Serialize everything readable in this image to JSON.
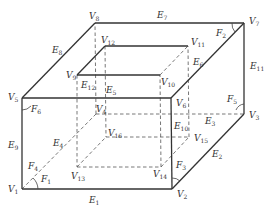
{
  "diagram": {
    "colors": {
      "line": "#333333",
      "dashed": "#555555",
      "background": "#ffffff"
    },
    "vertices": [
      {
        "id": "V1",
        "base": "V",
        "sub": "1",
        "x": 22,
        "y": 189
      },
      {
        "id": "V2",
        "base": "V",
        "sub": "2",
        "x": 172,
        "y": 189
      },
      {
        "id": "V3",
        "base": "V",
        "sub": "3",
        "x": 244,
        "y": 114
      },
      {
        "id": "V4",
        "base": "V",
        "sub": "4",
        "x": 96,
        "y": 114
      },
      {
        "id": "V5",
        "base": "V",
        "sub": "5",
        "x": 22,
        "y": 98
      },
      {
        "id": "V6",
        "base": "V",
        "sub": "6",
        "x": 171,
        "y": 98
      },
      {
        "id": "V7",
        "base": "V",
        "sub": "7",
        "x": 244,
        "y": 23
      },
      {
        "id": "V8",
        "base": "V",
        "sub": "8",
        "x": 95,
        "y": 23
      },
      {
        "id": "V9",
        "base": "V",
        "sub": "9",
        "x": 77,
        "y": 75
      },
      {
        "id": "V10",
        "base": "V",
        "sub": "10",
        "x": 160,
        "y": 75
      },
      {
        "id": "V11",
        "base": "V",
        "sub": "11",
        "x": 188,
        "y": 46
      },
      {
        "id": "V12",
        "base": "V",
        "sub": "12",
        "x": 105,
        "y": 46
      },
      {
        "id": "V13",
        "base": "V",
        "sub": "13",
        "x": 77,
        "y": 167
      },
      {
        "id": "V14",
        "base": "V",
        "sub": "14",
        "x": 161,
        "y": 167
      },
      {
        "id": "V15",
        "base": "V",
        "sub": "15",
        "x": 189,
        "y": 137
      },
      {
        "id": "V16",
        "base": "V",
        "sub": "16",
        "x": 106,
        "y": 137
      }
    ],
    "vertex_labels": [
      {
        "id": "V1",
        "base": "V",
        "sub": "1",
        "x": 8,
        "y": 192
      },
      {
        "id": "V2",
        "base": "V",
        "sub": "2",
        "x": 177,
        "y": 197
      },
      {
        "id": "V3",
        "base": "V",
        "sub": "3",
        "x": 249,
        "y": 118
      },
      {
        "id": "V4",
        "base": "V",
        "sub": "4",
        "x": 96,
        "y": 112
      },
      {
        "id": "V5",
        "base": "V",
        "sub": "5",
        "x": 8,
        "y": 100
      },
      {
        "id": "V6",
        "base": "V",
        "sub": "6",
        "x": 176,
        "y": 106
      },
      {
        "id": "V7",
        "base": "V",
        "sub": "7",
        "x": 249,
        "y": 24
      },
      {
        "id": "V8",
        "base": "V",
        "sub": "8",
        "x": 89,
        "y": 19
      },
      {
        "id": "V9",
        "base": "V",
        "sub": "9",
        "x": 66,
        "y": 78
      },
      {
        "id": "V10",
        "base": "V",
        "sub": "10",
        "x": 161,
        "y": 85
      },
      {
        "id": "V11",
        "base": "V",
        "sub": "11",
        "x": 191,
        "y": 45
      },
      {
        "id": "V12",
        "base": "V",
        "sub": "12",
        "x": 101,
        "y": 43
      },
      {
        "id": "V13",
        "base": "V",
        "sub": "13",
        "x": 71,
        "y": 179
      },
      {
        "id": "V14",
        "base": "V",
        "sub": "14",
        "x": 153,
        "y": 177
      },
      {
        "id": "V15",
        "base": "V",
        "sub": "15",
        "x": 194,
        "y": 141
      },
      {
        "id": "V16",
        "base": "V",
        "sub": "16",
        "x": 108,
        "y": 136
      }
    ],
    "edge_labels": [
      {
        "id": "E1",
        "base": "E",
        "sub": "1",
        "x": 89,
        "y": 203
      },
      {
        "id": "E2",
        "base": "E",
        "sub": "2",
        "x": 212,
        "y": 157
      },
      {
        "id": "E3",
        "base": "E",
        "sub": "3",
        "x": 205,
        "y": 124
      },
      {
        "id": "E4",
        "base": "E",
        "sub": "4",
        "x": 53,
        "y": 146
      },
      {
        "id": "E5",
        "base": "E",
        "sub": "5",
        "x": 106,
        "y": 93
      },
      {
        "id": "E6",
        "base": "E",
        "sub": "6",
        "x": 193,
        "y": 65
      },
      {
        "id": "E7",
        "base": "E",
        "sub": "7",
        "x": 157,
        "y": 18
      },
      {
        "id": "E8",
        "base": "E",
        "sub": "8",
        "x": 52,
        "y": 53
      },
      {
        "id": "E9",
        "base": "E",
        "sub": "9",
        "x": 8,
        "y": 148
      },
      {
        "id": "E10",
        "base": "E",
        "sub": "10",
        "x": 174,
        "y": 129
      },
      {
        "id": "E11",
        "base": "E",
        "sub": "11",
        "x": 250,
        "y": 69
      },
      {
        "id": "E12",
        "base": "E",
        "sub": "12",
        "x": 81,
        "y": 88
      }
    ],
    "face_labels": [
      {
        "id": "F1",
        "base": "F",
        "sub": "1",
        "x": 41,
        "y": 182
      },
      {
        "id": "F2",
        "base": "F",
        "sub": "2",
        "x": 216,
        "y": 36
      },
      {
        "id": "F3",
        "base": "F",
        "sub": "3",
        "x": 176,
        "y": 168
      },
      {
        "id": "F4",
        "base": "F",
        "sub": "4",
        "x": 28,
        "y": 169
      },
      {
        "id": "F5",
        "base": "F",
        "sub": "5",
        "x": 227,
        "y": 102
      },
      {
        "id": "F6",
        "base": "F",
        "sub": "6",
        "x": 31,
        "y": 112
      }
    ],
    "solid_edges": [
      [
        "V1",
        "V2"
      ],
      [
        "V2",
        "V3"
      ],
      [
        "V3",
        "V7"
      ],
      [
        "V5",
        "V1"
      ],
      [
        "V5",
        "V6"
      ],
      [
        "V6",
        "V2"
      ],
      [
        "V5",
        "V8"
      ],
      [
        "V8",
        "V7"
      ],
      [
        "V7",
        "V6"
      ],
      [
        "V9",
        "V10"
      ],
      [
        "V9",
        "V12"
      ],
      [
        "V12",
        "V11"
      ]
    ],
    "dashed_edges": [
      [
        "V1",
        "V4"
      ],
      [
        "V4",
        "V3"
      ],
      [
        "V4",
        "V8"
      ],
      [
        "V9",
        "V13"
      ],
      [
        "V13",
        "V14"
      ],
      [
        "V14",
        "V10"
      ],
      [
        "V12",
        "V16"
      ],
      [
        "V16",
        "V15"
      ],
      [
        "V15",
        "V11"
      ],
      [
        "V13",
        "V16"
      ],
      [
        "V14",
        "V15"
      ],
      [
        "V10",
        "V11"
      ]
    ]
  }
}
